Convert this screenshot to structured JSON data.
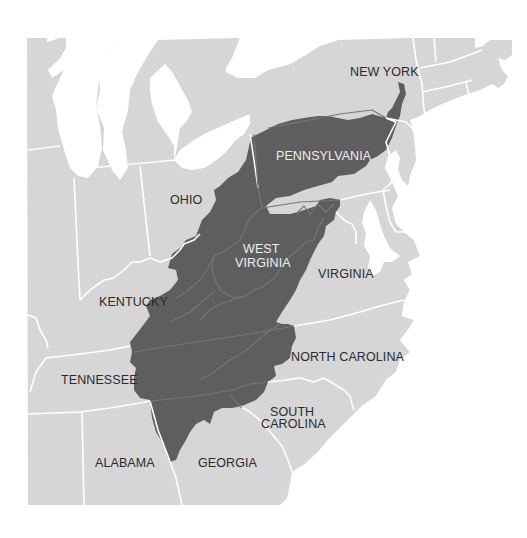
{
  "map": {
    "title": "",
    "colors": {
      "background": "#ffffff",
      "land": "#d6d6d6",
      "highlight_region": "#5e5e5e",
      "state_border": "#ffffff",
      "internal_border": "#7a7a7a",
      "label_dark": "#2b2b2b",
      "label_light": "#eeeeee"
    },
    "highlighted_region": "Appalachian region",
    "labels": {
      "new_york": "NEW YORK",
      "pennsylvania": "PENNSYLVANIA",
      "ohio": "OHIO",
      "west_virginia_line1": "WEST",
      "west_virginia_line2": "VIRGINIA",
      "virginia": "VIRGINIA",
      "kentucky": "KENTUCKY",
      "north_carolina": "NORTH CAROLINA",
      "tennessee": "TENNESSEE",
      "south_carolina_line1": "SOUTH",
      "south_carolina_line2": "CAROLINA",
      "alabama": "ALABAMA",
      "georgia": "GEORGIA"
    }
  }
}
